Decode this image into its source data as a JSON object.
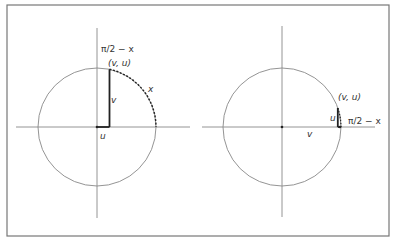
{
  "figure": {
    "frame": {
      "x": 7,
      "y": 5,
      "width": 382,
      "height": 231,
      "stroke": "#777777"
    },
    "colors": {
      "axis": "#888888",
      "circle": "#888888",
      "segment": "#222222",
      "arc": "#222222",
      "text": "#333333"
    },
    "left_panel": {
      "center": [
        97,
        127
      ],
      "radius": 59,
      "h_axis": [
        16,
        190
      ],
      "v_axis": [
        28,
        218
      ],
      "point_label": "(v, u)",
      "angle_label": "π/2 − x",
      "arc_label": "x",
      "vertical_segment_label": "v",
      "horizontal_segment_label": "u"
    },
    "right_panel": {
      "center": [
        282,
        127
      ],
      "radius": 59,
      "h_axis": [
        202,
        375
      ],
      "v_axis": [
        26,
        217
      ],
      "point_label": "(v, u)",
      "angle_label": "π/2 − x",
      "vertical_segment_label": "u",
      "horizontal_segment_label": "v"
    }
  }
}
